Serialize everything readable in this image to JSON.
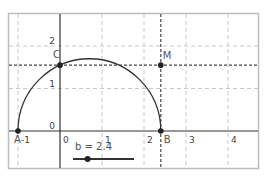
{
  "view": {
    "x_range": [
      -1.25,
      4.7
    ],
    "y_range": [
      -0.9,
      2.8
    ],
    "grid": true,
    "x_ticks": [
      {
        "value": -1,
        "label": "-1"
      },
      {
        "value": 0,
        "label": "0"
      },
      {
        "value": 1,
        "label": "1"
      },
      {
        "value": 2,
        "label": "2"
      },
      {
        "value": 3,
        "label": "3"
      },
      {
        "value": 4,
        "label": "4"
      }
    ],
    "y_ticks": [
      {
        "value": 0,
        "label": "0"
      },
      {
        "value": 1,
        "label": "1"
      },
      {
        "value": 2,
        "label": "2"
      }
    ]
  },
  "slider": {
    "name": "b",
    "label": "b = 2.4",
    "value": 2.4,
    "min": 0,
    "max": 10
  },
  "points": [
    {
      "id": "A",
      "label": "A",
      "x": -1,
      "y": 0
    },
    {
      "id": "B",
      "label": "B",
      "x": 2.4,
      "y": 0
    },
    {
      "id": "C",
      "label": "C",
      "x": 0,
      "y": 1.549
    },
    {
      "id": "M",
      "label": "M",
      "x": 2.4,
      "y": 1.549
    }
  ],
  "semicircle": {
    "from": "A",
    "to": "B"
  },
  "guide_lines": [
    {
      "type": "vertical",
      "through": "B"
    },
    {
      "type": "horizontal",
      "through": "C"
    }
  ],
  "colors": {
    "axis": "#333333",
    "grid": "#c8c8c8",
    "curve": "#333333",
    "point": "#222222",
    "frame": "#bdbdbd",
    "guide": "#444444"
  }
}
